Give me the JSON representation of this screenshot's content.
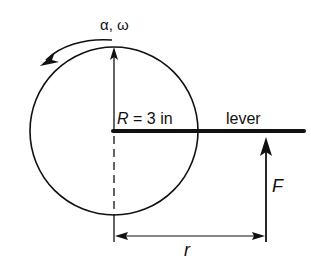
{
  "diagram": {
    "rotation_label": "α, ω",
    "radius_label_var": "R",
    "radius_label_rest": " = 3 in",
    "lever_label": "lever",
    "force_label": "F",
    "distance_label": "r"
  },
  "colors": {
    "ink": "#111111",
    "background": "#ffffff"
  }
}
